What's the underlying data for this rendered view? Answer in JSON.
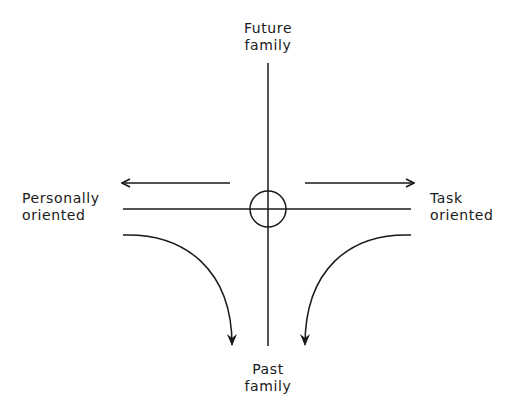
{
  "diagram": {
    "labels": {
      "top": {
        "line1": "Future",
        "line2": "family"
      },
      "bottom": {
        "line1": "Past",
        "line2": "family"
      },
      "left": {
        "line1": "Personally",
        "line2": "oriented"
      },
      "right": {
        "line1": "Task",
        "line2": "oriented"
      }
    },
    "elements": {
      "vertical_axis": "Future family to Past family axis",
      "horizontal_axis": "Personally oriented to Task oriented axis",
      "center_circle": "origin circle",
      "arrow_left": "straight arrow pointing left",
      "arrow_right": "straight arrow pointing right",
      "curved_arrow_left": "curved arrow bending down toward Past family",
      "curved_arrow_right": "curved arrow bending down toward Past family"
    },
    "stroke_color": "#1a1a1a"
  }
}
